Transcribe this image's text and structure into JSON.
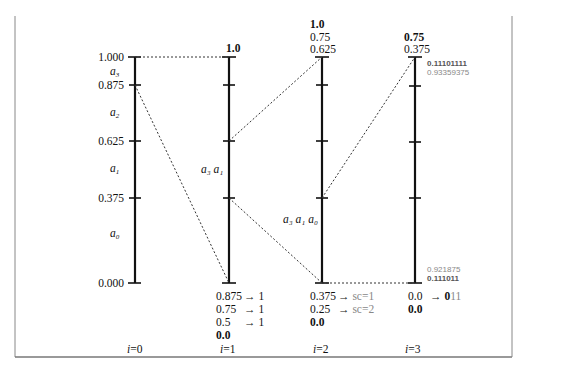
{
  "diagram": {
    "axes": [
      {
        "label_prefix": "i",
        "label_index": "=0",
        "ticks": [
          "1.000",
          "0.875",
          "0.625",
          "0.375",
          "0.000"
        ],
        "symbols": [
          {
            "name": "a",
            "sub": "3"
          },
          {
            "name": "a",
            "sub": "2"
          },
          {
            "name": "a",
            "sub": "1"
          },
          {
            "name": "a",
            "sub": "0"
          }
        ]
      },
      {
        "label_prefix": "i",
        "label_index": "=1",
        "top": [
          "1.0"
        ],
        "bottom": [
          {
            "value": "0.875",
            "arrow": "→ 1"
          },
          {
            "value": "0.75",
            "arrow": "→ 1"
          },
          {
            "value": "0.5",
            "arrow": "→ 1"
          },
          {
            "value": "0.0",
            "bold": true
          }
        ],
        "side_symbols": "a₃ a₁"
      },
      {
        "label_prefix": "i",
        "label_index": "=2",
        "top": [
          "1.0",
          "0.75",
          "0.625"
        ],
        "bottom": [
          {
            "value": "0.375",
            "arrow": "→",
            "note": "sc=1"
          },
          {
            "value": "0.25",
            "arrow": "→",
            "note": "sc=2"
          },
          {
            "value": "0.0",
            "bold": true
          }
        ],
        "side_symbols": "a₃ a₁ a₀"
      },
      {
        "label_prefix": "i",
        "label_index": "=3",
        "top": [
          "0.75",
          "0.375"
        ],
        "top_annot": [
          "0.11101111",
          "0.93359375"
        ],
        "bottom_annot": [
          "0.921875",
          "0.111011"
        ],
        "bottom": [
          {
            "value": "0.0",
            "arrow": "→",
            "code_bold": "0",
            "code_rest": "11"
          },
          {
            "value": "0.0",
            "bold": true
          }
        ]
      }
    ],
    "colors": {
      "axis": "#111111",
      "dotted": "#333333",
      "gray_text": "#888888",
      "frame": "#777777"
    }
  }
}
